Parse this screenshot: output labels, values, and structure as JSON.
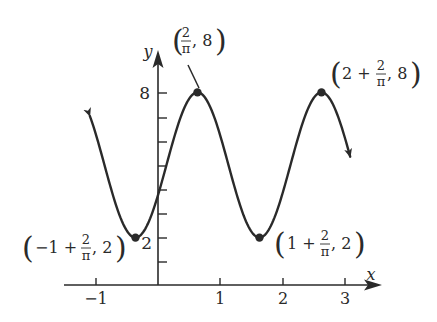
{
  "chart_data": {
    "type": "line",
    "title": "",
    "xlabel": "x",
    "ylabel": "y",
    "function": "y = 5 + 3 cos(pi * (x - 2/pi))",
    "xlim": [
      -1.2,
      3.5
    ],
    "ylim": [
      0,
      9
    ],
    "x_ticks": [
      -1,
      1,
      2,
      3
    ],
    "x_tick_labels": [
      "−1",
      "1",
      "2",
      "3"
    ],
    "y_ticks": [
      1,
      2,
      3,
      4,
      5,
      6,
      7,
      8
    ],
    "y_tick_labels": [
      {
        "value": 2,
        "label": "2"
      },
      {
        "value": 8,
        "label": "8"
      }
    ],
    "grid": false,
    "legend": null,
    "series": [
      {
        "name": "curve",
        "x_range": [
          -1.1,
          3.1
        ],
        "arrows_at_both_ends": true
      }
    ],
    "marked_points": [
      {
        "x": -0.3634,
        "y": 2,
        "label": "(−1 + 2/π, 2)"
      },
      {
        "x": 0.6366,
        "y": 8,
        "label": "(2/π, 8)"
      },
      {
        "x": 1.6366,
        "y": 2,
        "label": "(1 + 2/π, 2)"
      },
      {
        "x": 2.6366,
        "y": 8,
        "label": "(2 + 2/π, 8)"
      }
    ]
  },
  "axes": {
    "x_label": "x",
    "y_label": "y",
    "x_tick_labels": [
      "−1",
      "1",
      "2",
      "3"
    ],
    "y_tick_label_low": "2",
    "y_tick_label_high": "8"
  },
  "annotations": {
    "peak1": {
      "prefix": "",
      "frac_num": "2",
      "frac_den": "π",
      "suffix": ", 8"
    },
    "peak2": {
      "prefix": "2 + ",
      "frac_num": "2",
      "frac_den": "π",
      "suffix": ", 8"
    },
    "min1": {
      "prefix": "−1 + ",
      "frac_num": "2",
      "frac_den": "π",
      "suffix": ", 2"
    },
    "min2": {
      "prefix": "1 + ",
      "frac_num": "2",
      "frac_den": "π",
      "suffix": ", 2"
    }
  }
}
